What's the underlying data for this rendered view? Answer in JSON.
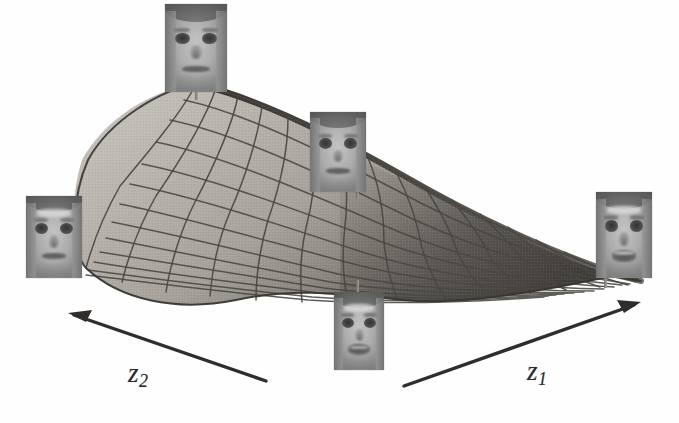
{
  "figure": {
    "kind": "3d-surface-manifold",
    "background_color": "#fefefe",
    "surface": {
      "fill_light": "#b6b2ac",
      "fill_dark": "#55514c",
      "gridline_color": "#4a4742",
      "edge_color": "#3a3733",
      "grid_u_count": 16,
      "grid_v_count": 16
    },
    "axes": [
      {
        "id": "z2",
        "label": "z",
        "subscript": "2",
        "arrow_direction": "left",
        "arrow_from": [
          266,
          381
        ],
        "arrow_to": [
          68,
          313
        ],
        "label_position": [
          128,
          360
        ]
      },
      {
        "id": "z1",
        "label": "z",
        "subscript": "1",
        "arrow_direction": "right",
        "arrow_from": [
          404,
          386
        ],
        "arrow_to": [
          641,
          302
        ],
        "label_position": [
          527,
          358
        ]
      }
    ],
    "face_samples": [
      {
        "id": "face-top",
        "position": [
          165,
          6
        ],
        "size": [
          62,
          86
        ],
        "expression": "neutral",
        "stem": {
          "x": 195,
          "y": 86,
          "height": 14
        }
      },
      {
        "id": "face-left",
        "position": [
          26,
          196
        ],
        "size": [
          56,
          80
        ],
        "expression": "neutral-lit",
        "stem": {
          "x": 78,
          "y": 258,
          "height": 20
        }
      },
      {
        "id": "face-center",
        "position": [
          310,
          112
        ],
        "size": [
          56,
          78
        ],
        "expression": "neutral",
        "stem": {
          "x": 356,
          "y": 178,
          "height": 20
        }
      },
      {
        "id": "face-bottom",
        "position": [
          334,
          292
        ],
        "size": [
          50,
          76
        ],
        "expression": "open-mouth",
        "stem": {
          "x": 356,
          "y": 282,
          "height": 14
        }
      },
      {
        "id": "face-right",
        "position": [
          596,
          194
        ],
        "size": [
          56,
          84
        ],
        "expression": "smiling",
        "stem": {
          "x": 604,
          "y": 274,
          "height": 14
        }
      }
    ]
  }
}
